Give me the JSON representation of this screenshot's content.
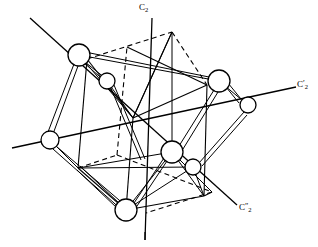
{
  "figure": {
    "background_color": "#ffffff",
    "line_color": "#000000",
    "atom_fill_color": "#ffffff",
    "width": 318,
    "height": 247
  },
  "axes": [
    {
      "id": "c2-main",
      "label_base": "C",
      "label_sub": "2",
      "label_prime": "",
      "orientation": "vertical",
      "x1": 152,
      "y1": 18,
      "x2": 145,
      "y2": 240
    },
    {
      "id": "c2-prime",
      "label_base": "C",
      "label_sub": "2",
      "label_prime": "′",
      "orientation": "horizontal-right",
      "x1": 12,
      "y1": 148,
      "x2": 296,
      "y2": 87
    },
    {
      "id": "c2-double-prime",
      "label_base": "C",
      "label_sub": "2",
      "label_prime": "″",
      "orientation": "diagonal",
      "x1": 30,
      "y1": 18,
      "x2": 237,
      "y2": 205
    }
  ],
  "labels": {
    "c2_main": "C",
    "c2_main_sub": "2",
    "c2_prime": "C",
    "c2_prime_sub": "2",
    "c2_prime_mark": "′",
    "c2_double_prime": "C",
    "c2_double_prime_sub": "2",
    "c2_double_prime_mark": "″"
  },
  "cube": {
    "description": "Reference cube drawn with solid front edges and dashed hidden rear edges",
    "vertices": {
      "top_front_left": {
        "x": 87,
        "y": 59
      },
      "top_front_right": {
        "x": 207,
        "y": 85
      },
      "top_back_left": {
        "x": 127,
        "y": 47
      },
      "top_back_right": {
        "x": 172,
        "y": 32
      },
      "bottom_front_left": {
        "x": 78,
        "y": 168
      },
      "bottom_front_right": {
        "x": 204,
        "y": 196
      },
      "bottom_back_left": {
        "x": 117,
        "y": 155
      },
      "bottom_back_right": {
        "x": 212,
        "y": 192
      }
    },
    "solid_edges": 9,
    "dashed_edges": 5
  },
  "atoms": [
    {
      "id": "atom-large-top-left",
      "x": 79,
      "y": 55,
      "r": 11,
      "size": "large",
      "on_axis": "c2-double-prime"
    },
    {
      "id": "atom-small-upper-mid",
      "x": 107,
      "y": 81,
      "r": 8,
      "size": "small",
      "on_axis": "none"
    },
    {
      "id": "atom-large-right",
      "x": 219,
      "y": 81,
      "r": 11,
      "size": "large",
      "on_axis": "none"
    },
    {
      "id": "atom-small-right",
      "x": 248,
      "y": 105,
      "r": 8,
      "size": "small",
      "on_axis": "c2-prime"
    },
    {
      "id": "atom-medium-left",
      "x": 50,
      "y": 140,
      "r": 9,
      "size": "medium",
      "on_axis": "c2-prime"
    },
    {
      "id": "atom-large-center",
      "x": 172,
      "y": 152,
      "r": 11,
      "size": "large",
      "on_axis": "c2-main"
    },
    {
      "id": "atom-small-center-right",
      "x": 193,
      "y": 167,
      "r": 8,
      "size": "small",
      "on_axis": "none"
    },
    {
      "id": "atom-large-bottom",
      "x": 126,
      "y": 210,
      "r": 11,
      "size": "large",
      "on_axis": "c2-main"
    }
  ],
  "bonds": {
    "double_bond_count": 8,
    "single_bond_count": 10,
    "description": "Double-ruled lines connect the large and small spheres forming the distorted coordination polyhedron"
  }
}
